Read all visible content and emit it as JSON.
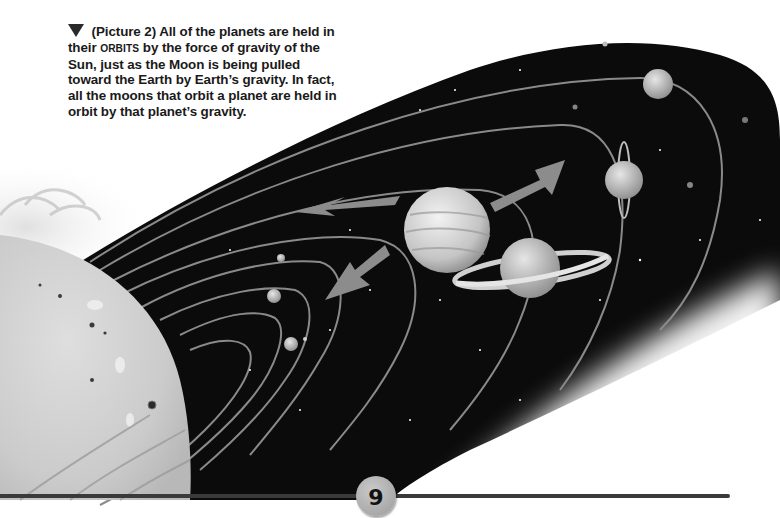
{
  "caption": {
    "marker_icon": "down-triangle-icon",
    "parts": [
      " (Picture 2) All of the planets are held in their ",
      "ORBITS",
      " by the force of gravity of the Sun, just as the Moon is being pulled toward the Earth by Earth’s gravity. In fact, all the moons that orbit a planet are held in orbit by that planet’s gravity."
    ]
  },
  "illustration": {
    "subject": "Solar system diagram: Sun with planets on orbits, gray arrows showing orbital motion",
    "colors": {
      "space": "#0b0b0b",
      "orbit_line": "#8a8a8a",
      "arrow": "#8c8c8c",
      "sun": "#cfcfcf"
    }
  },
  "footer": {
    "page_number": "9",
    "rule_color": "#3a3a3a",
    "badge_color": "#b0b0b0"
  }
}
